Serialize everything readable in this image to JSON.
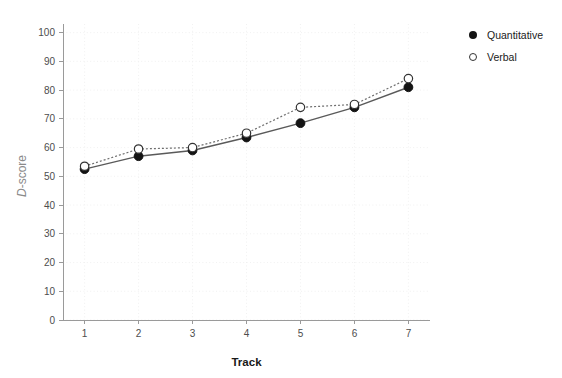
{
  "chart_data": {
    "type": "line",
    "title": "",
    "xlabel": "Track",
    "ylabel": "D-score",
    "ylabel_italic_part": "D",
    "ylabel_rest_part": "-score",
    "x": [
      1,
      2,
      3,
      4,
      5,
      6,
      7
    ],
    "categories": [
      "1",
      "2",
      "3",
      "4",
      "5",
      "6",
      "7"
    ],
    "xlim": [
      0.6,
      7.4
    ],
    "ylim": [
      0,
      103
    ],
    "yticks": [
      0,
      10,
      20,
      30,
      40,
      50,
      60,
      70,
      80,
      90,
      100
    ],
    "ytick_labels": [
      "0",
      "10",
      "20",
      "30",
      "40",
      "50",
      "60",
      "70",
      "80",
      "90",
      "100"
    ],
    "xticks": [
      1,
      2,
      3,
      4,
      5,
      6,
      7
    ],
    "xtick_labels": [
      "1",
      "2",
      "3",
      "4",
      "5",
      "6",
      "7"
    ],
    "grid": true,
    "grid_style": "dotted",
    "legend_position": "top-right",
    "series": [
      {
        "name": "Quantitative",
        "marker": "filled-circle",
        "line_style": "solid",
        "color": "#141414",
        "values": [
          52.5,
          57.0,
          59.0,
          63.5,
          68.5,
          74.0,
          81.0
        ]
      },
      {
        "name": "Verbal",
        "marker": "open-circle",
        "line_style": "dotted",
        "color": "#333333",
        "values": [
          53.5,
          59.5,
          60.0,
          65.0,
          74.0,
          75.0,
          84.0
        ]
      }
    ]
  },
  "legend": {
    "items": [
      {
        "label": "Quantitative",
        "marker": "filled-circle"
      },
      {
        "label": "Verbal",
        "marker": "open-circle"
      }
    ]
  },
  "colors": {
    "background": "#ffffff",
    "axis": "#9a9a9a",
    "grid": "#ededed",
    "tick_text": "#4d4d4d",
    "axis_title": "#1a1a1a",
    "y_axis_title": "#8a8a8a",
    "quantitative": "#141414",
    "verbal": "#333333"
  }
}
